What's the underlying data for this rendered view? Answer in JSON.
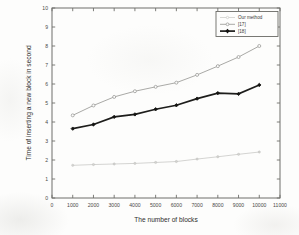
{
  "figure": {
    "background_color": "#fdfdfc",
    "frame_color": "#6f6f6b"
  },
  "chart_data": {
    "type": "line",
    "title": "",
    "subtitle": "",
    "xlabel": "The number of blocks",
    "ylabel": "Time of inserting a new block in second",
    "xlim": [
      0,
      11000
    ],
    "ylim": [
      0,
      10
    ],
    "xticks": [
      0,
      1000,
      2000,
      3000,
      4000,
      5000,
      6000,
      7000,
      8000,
      9000,
      10000,
      11000
    ],
    "xticklabels": [
      "0",
      "1000",
      "2000",
      "3000",
      "4000",
      "5000",
      "6000",
      "7000",
      "8000",
      "9000",
      "10000",
      "11000"
    ],
    "yticks": [
      0,
      1,
      2,
      3,
      4,
      5,
      6,
      7,
      8,
      9,
      10
    ],
    "yticklabels": [
      "0",
      "1",
      "2",
      "3",
      "4",
      "5",
      "6",
      "7",
      "8",
      "9",
      "10"
    ],
    "grid": false,
    "legend_position": "upper right",
    "x": [
      1000,
      2000,
      3000,
      4000,
      5000,
      6000,
      7000,
      8000,
      9000,
      10000
    ],
    "series": [
      {
        "name": "Our method",
        "color": "#c9c9c6",
        "marker": "circle-open",
        "values": [
          1.72,
          1.76,
          1.79,
          1.82,
          1.87,
          1.92,
          2.05,
          2.17,
          2.3,
          2.42
        ]
      },
      {
        "name": "[17]",
        "color": "#a9a9a6",
        "marker": "circle-open",
        "values": [
          4.35,
          4.87,
          5.32,
          5.62,
          5.85,
          6.07,
          6.48,
          6.94,
          7.42,
          8.0
        ]
      },
      {
        "name": "[18]",
        "color": "#1d1d1b",
        "marker": "diamond-filled",
        "values": [
          3.65,
          3.87,
          4.27,
          4.4,
          4.67,
          4.88,
          5.23,
          5.52,
          5.48,
          5.95
        ]
      }
    ]
  },
  "legend": {
    "entries": [
      {
        "label": "Our method"
      },
      {
        "label": "[17]"
      },
      {
        "label": "[18]"
      }
    ]
  }
}
